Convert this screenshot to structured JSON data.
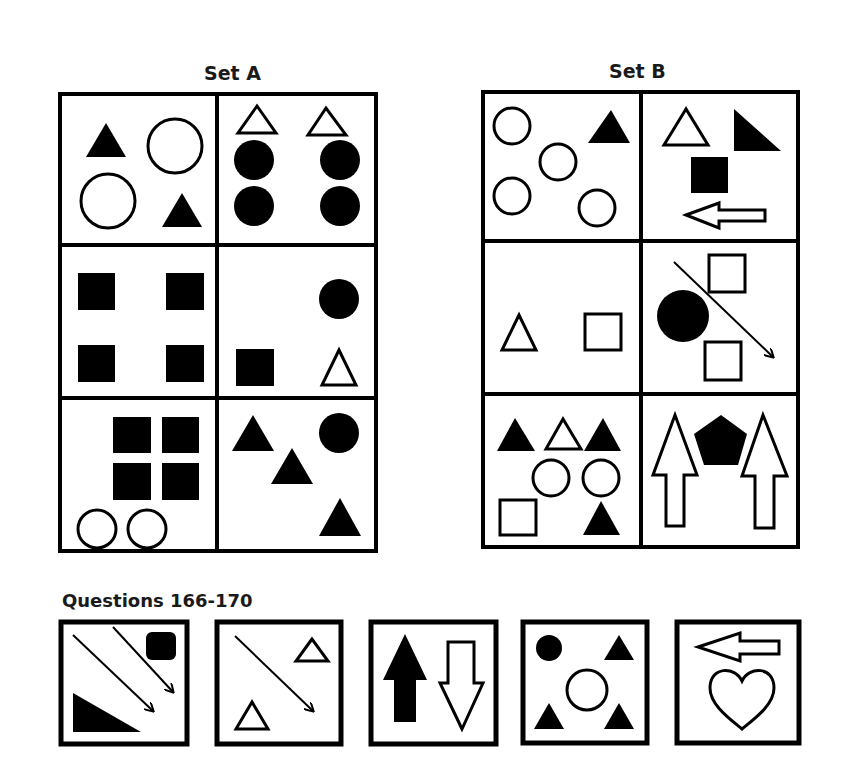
{
  "sets": {
    "a": {
      "title": "Set A",
      "cells": [
        {
          "row": 1,
          "col": 1,
          "contents": "2 filled triangles, 2 outline circles"
        },
        {
          "row": 1,
          "col": 2,
          "contents": "2 outline triangles, 4 filled circles"
        },
        {
          "row": 2,
          "col": 1,
          "contents": "4 filled squares"
        },
        {
          "row": 2,
          "col": 2,
          "contents": "1 filled circle, 1 filled square, 1 outline triangle"
        },
        {
          "row": 3,
          "col": 1,
          "contents": "4 filled squares, 2 outline circles"
        },
        {
          "row": 3,
          "col": 2,
          "contents": "3 filled triangles, 1 filled circle"
        }
      ]
    },
    "b": {
      "title": "Set B",
      "cells": [
        {
          "row": 1,
          "col": 1,
          "contents": "4 outline circles, 1 filled triangle"
        },
        {
          "row": 1,
          "col": 2,
          "contents": "1 outline triangle, 1 filled right triangle, 1 filled square, 1 outline left arrow"
        },
        {
          "row": 2,
          "col": 1,
          "contents": "1 outline triangle, 1 outline square"
        },
        {
          "row": 2,
          "col": 2,
          "contents": "1 filled circle, 2 outline squares, 1 diagonal arrow"
        },
        {
          "row": 3,
          "col": 1,
          "contents": "2 filled triangles, 1 outline triangle, 2 outline circles, 1 outline square, 1 filled triangle"
        },
        {
          "row": 3,
          "col": 2,
          "contents": "2 outline up arrows, 1 filled pentagon"
        }
      ]
    }
  },
  "questions": {
    "title": "Questions 166-170",
    "items": [
      {
        "number": 166,
        "contents": "2 diagonal arrows, 1 filled rounded square, 1 filled right triangle"
      },
      {
        "number": 167,
        "contents": "1 diagonal arrow, 2 outline triangles"
      },
      {
        "number": 168,
        "contents": "1 filled up arrow, 1 outline down arrow"
      },
      {
        "number": 169,
        "contents": "1 filled circle, 3 filled triangles, 1 outline circle"
      },
      {
        "number": 170,
        "contents": "1 outline left arrow, 1 outline heart"
      }
    ]
  },
  "colors": {
    "ink": "#000000",
    "background": "#ffffff",
    "title": "#1a1a1a"
  }
}
